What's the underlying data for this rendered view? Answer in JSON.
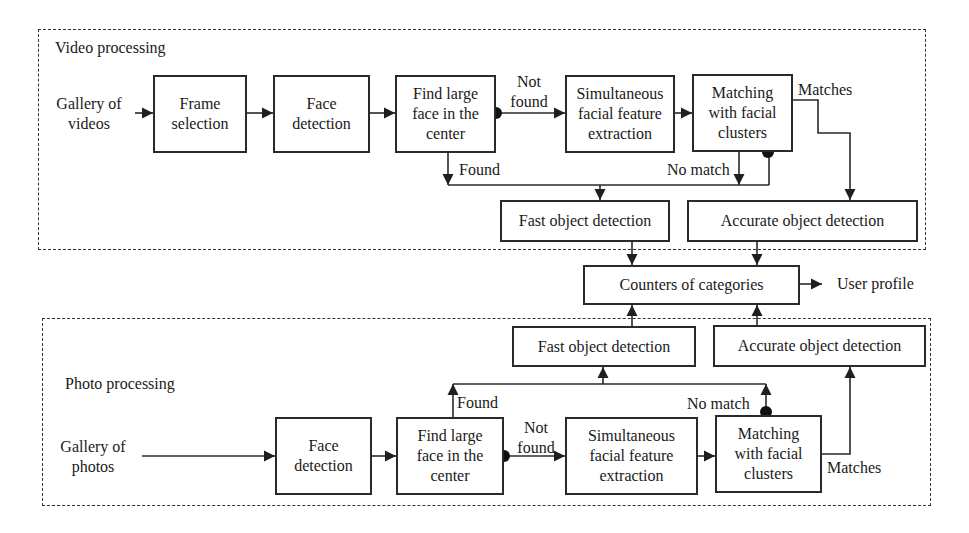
{
  "diagram": {
    "video_group": {
      "title": "Video processing",
      "source_label": "Gallery of\nvideos",
      "steps": {
        "frame_selection": "Frame\nselection",
        "face_detection": "Face\ndetection",
        "find_large_face": "Find large\nface in the\ncenter",
        "feature_extraction": "Simultaneous\nfacial feature\nextraction",
        "matching": "Matching\nwith facial\nclusters",
        "fast_detection": "Fast object detection",
        "accurate_detection": "Accurate object detection"
      },
      "edge_labels": {
        "not_found": "Not\nfound",
        "found": "Found",
        "matches": "Matches",
        "no_match": "No match"
      }
    },
    "shared": {
      "counters": "Counters of categories",
      "output": "User profile"
    },
    "photo_group": {
      "title": "Photo processing",
      "source_label": "Gallery of\nphotos",
      "steps": {
        "face_detection": "Face\ndetection",
        "find_large_face": "Find large\nface in the\ncenter",
        "feature_extraction": "Simultaneous\nfacial feature\nextraction",
        "matching": "Matching\nwith facial\nclusters",
        "fast_detection": "Fast object detection",
        "accurate_detection": "Accurate object detection"
      },
      "edge_labels": {
        "not_found": "Not\nfound",
        "found": "Found",
        "matches": "Matches",
        "no_match": "No match"
      }
    },
    "colors": {
      "line": "#2a2a2a",
      "background": "#ffffff"
    }
  }
}
